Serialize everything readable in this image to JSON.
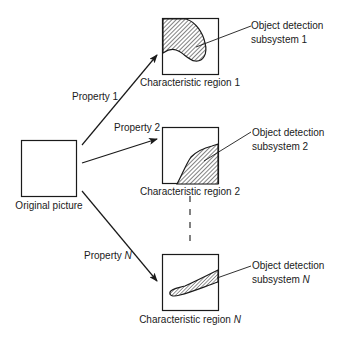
{
  "original": {
    "label": "Original picture"
  },
  "properties": [
    {
      "label": "Property 1"
    },
    {
      "label": "Property 2"
    },
    {
      "label_prefix": "Property ",
      "label_var": "N"
    }
  ],
  "regions": [
    {
      "label": "Characteristic region 1",
      "subsystem_line1": "Object detection",
      "subsystem_line2": "subsystem 1"
    },
    {
      "label": "Characteristic region 2",
      "subsystem_line1": "Object detection",
      "subsystem_line2": "subsystem 2"
    },
    {
      "label_prefix": "Characteristic region ",
      "label_var": "N",
      "subsystem_line1": "Object detection",
      "subsystem_line2_prefix": "subsystem ",
      "subsystem_line2_var": "N"
    }
  ],
  "colors": {
    "stroke": "#1a1a1a",
    "hatch": "#1a1a1a",
    "background": "#ffffff"
  }
}
